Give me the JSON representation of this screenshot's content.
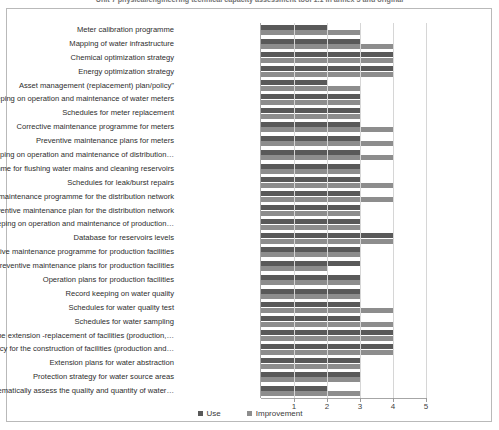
{
  "title": "Unit 7 physical/engineering technical capacity assessment tool 1.1 in annex 5 and original",
  "legend": {
    "use_label": "Use",
    "improvement_label": "Improvement"
  },
  "colors": {
    "use": "#595959",
    "improvement": "#8d8d8d",
    "gridline": "#d6d6d6",
    "axis": "#a6a6a6",
    "frame": "#b9b9b9"
  },
  "chart_data": {
    "type": "bar",
    "orientation": "horizontal",
    "title": "Unit 7 physical/engineering technical capacity assessment tool 1.1 in annex 5 and original",
    "xlabel": "",
    "ylabel": "",
    "xlim": [
      0,
      5
    ],
    "xticks": [
      1,
      2,
      3,
      4,
      5
    ],
    "grid": true,
    "legend_position": "bottom",
    "categories": [
      "Meter calibration programme",
      "Mapping of water infrastructure",
      "Chemical optimization strategy",
      "Energy optimization strategy",
      "Asset management (replacement) plan/policy\"",
      "Record keeping on operation and maintenance of water meters",
      "Schedules for meter replacement",
      "Corrective maintenance programme for meters",
      "Preventive maintenance plans for meters",
      "Record keeping on operation and maintenance of distribution…",
      "Programme for flushing water mains and cleaning reservoirs",
      "Schedules for leak/burst repairs",
      "Corrective maintenance programme for the distribution network",
      "Preventive  maintenance plan for the distribution network",
      "Record keeping on operation and maintenance of production…",
      "Database for reservoirs levels",
      "Corrective maintenance programme for  production facilities",
      "Preventive maintenance plans for production facilities",
      "Operation plans for production facilities",
      "Record keeping on water quality",
      "Schedules for water quality test",
      "Schedules for water sampling",
      "Plans for the extension -replacement of facilities (production,…",
      "Policy for the construction of facilities (production and…",
      "Extension plans for water abstraction",
      "Protection strategy for water source areas",
      "Plans to systematically assess the  quality and quantity of water…"
    ],
    "series": [
      {
        "name": "Use",
        "values": [
          2,
          3,
          4,
          4,
          2,
          3,
          3,
          3,
          3,
          3,
          3,
          3,
          3,
          3,
          3,
          4,
          3,
          3,
          3,
          3,
          3,
          3,
          4,
          4,
          3,
          3,
          2
        ]
      },
      {
        "name": "Improvement",
        "values": [
          3,
          4,
          4,
          4,
          3,
          3,
          3,
          4,
          4,
          4,
          3,
          4,
          4,
          3,
          3,
          4,
          3,
          2,
          3,
          3,
          4,
          4,
          4,
          4,
          3,
          3,
          3
        ]
      }
    ]
  }
}
